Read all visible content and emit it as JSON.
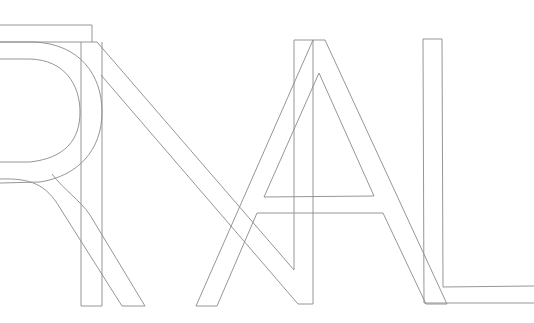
{
  "artwork": {
    "description": "Overlapping outlined letterforms",
    "letters": [
      "R",
      "T",
      "N",
      "A",
      "L"
    ],
    "text": "RTNAL",
    "stroke_color": "#8a8a8a",
    "background_color": "#ffffff"
  }
}
